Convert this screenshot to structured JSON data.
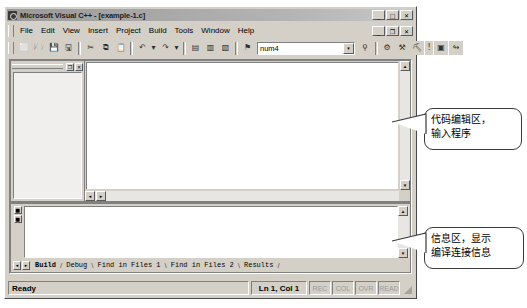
{
  "window": {
    "title": "Microsoft Visual C++ - [example-1.c]",
    "app_icon": "visual-cpp-icon",
    "controls": {
      "minimize": "_",
      "maximize": "□",
      "close": "✕"
    }
  },
  "menu": {
    "items": [
      {
        "label": "File",
        "accel": "F"
      },
      {
        "label": "Edit",
        "accel": "E"
      },
      {
        "label": "View",
        "accel": "V"
      },
      {
        "label": "Insert",
        "accel": "I"
      },
      {
        "label": "Project",
        "accel": "P"
      },
      {
        "label": "Build",
        "accel": "B"
      },
      {
        "label": "Tools",
        "accel": "T"
      },
      {
        "label": "Window",
        "accel": "W"
      },
      {
        "label": "Help",
        "accel": "H"
      }
    ],
    "doc_controls": {
      "minimize": "_",
      "restore": "❐",
      "close": "✕"
    }
  },
  "toolbar": {
    "buttons": [
      {
        "name": "new-file-icon",
        "glyph": "⬜"
      },
      {
        "name": "open-folder-icon",
        "glyph": "🗁"
      },
      {
        "name": "save-icon",
        "glyph": "💾"
      },
      {
        "name": "save-all-icon",
        "glyph": "🖫"
      },
      {
        "name": "cut-icon",
        "glyph": "✂"
      },
      {
        "name": "copy-icon",
        "glyph": "⧉"
      },
      {
        "name": "paste-icon",
        "glyph": "📋"
      },
      {
        "name": "undo-icon",
        "glyph": "↶"
      },
      {
        "name": "undo-dropdown-icon",
        "glyph": "▾"
      },
      {
        "name": "redo-icon",
        "glyph": "↷"
      },
      {
        "name": "redo-dropdown-icon",
        "glyph": "▾"
      },
      {
        "name": "workspace-toggle-icon",
        "glyph": "▤"
      },
      {
        "name": "output-toggle-icon",
        "glyph": "▥"
      },
      {
        "name": "watch-toggle-icon",
        "glyph": "▧"
      },
      {
        "name": "find-in-files-icon",
        "glyph": "⚑"
      }
    ],
    "search_combo": {
      "value": "num4",
      "arrow": "▾"
    },
    "buttons_right": [
      {
        "name": "find-binoculars-icon",
        "glyph": "⚲"
      },
      {
        "name": "compile-icon",
        "glyph": "⚙"
      },
      {
        "name": "build-icon",
        "glyph": "⚒"
      },
      {
        "name": "rebuild-all-icon",
        "glyph": "⛏"
      },
      {
        "name": "stop-build-icon",
        "glyph": "!"
      },
      {
        "name": "execute-program-icon",
        "glyph": "▣"
      },
      {
        "name": "go-debug-icon",
        "glyph": "↬"
      }
    ]
  },
  "workspace": {
    "caption_buttons": {
      "restore": "❐",
      "close": "✕"
    }
  },
  "editor": {
    "vscroll": {
      "up": "▴",
      "down": "▾"
    },
    "hscroll": {
      "left": "◂",
      "right": "▸"
    }
  },
  "output": {
    "gutter_buttons": [
      {
        "name": "output-goto-error-icon",
        "glyph": "■"
      },
      {
        "name": "output-next-error-icon",
        "glyph": "■"
      }
    ],
    "vscroll": {
      "up": "▴",
      "down": "▾"
    },
    "tab_scroll": {
      "left": "◂",
      "right": "▸"
    },
    "tabs": [
      {
        "label": "Build",
        "active": true
      },
      {
        "label": "Debug",
        "active": false
      },
      {
        "label": "Find in Files 1",
        "active": false
      },
      {
        "label": "Find in Files 2",
        "active": false
      },
      {
        "label": "Results",
        "active": false
      }
    ]
  },
  "status_bar": {
    "message": "Ready",
    "position": "Ln 1, Col 1",
    "indicators": [
      "REC",
      "COL",
      "OVR",
      "READ"
    ]
  },
  "callouts": [
    {
      "name": "callout-editor",
      "line1": "代码编辑区，",
      "line2": "输入程序"
    },
    {
      "name": "callout-output",
      "line1": "信息区，显示",
      "line2": "编译连接信息"
    }
  ]
}
